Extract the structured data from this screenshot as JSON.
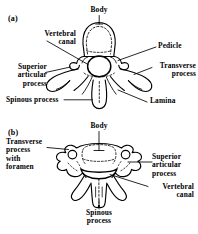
{
  "figure": {
    "background_color": "#ffffff",
    "ink_color": "#000000",
    "width": 198,
    "height": 234,
    "caption_style": "anatomical line drawing, superior view of vertebrae"
  },
  "panels": [
    {
      "tag": "(a)",
      "subject": "thoracic vertebra, superior view",
      "labels": [
        {
          "name": "body",
          "text": "Body",
          "lines": [
            "Body"
          ]
        },
        {
          "name": "vertebral-canal",
          "text": "Vertebral canal",
          "lines": [
            "Vertebral",
            "canal"
          ]
        },
        {
          "name": "superior-articular-process",
          "text": "Superior articular process",
          "lines": [
            "Superior",
            "articular",
            "process"
          ]
        },
        {
          "name": "spinous-process",
          "text": "Spinous process",
          "lines": [
            "Spinous process"
          ]
        },
        {
          "name": "pedicle",
          "text": "Pedicle",
          "lines": [
            "Pedicle"
          ]
        },
        {
          "name": "transverse-process",
          "text": "Transverse process",
          "lines": [
            "Transverse",
            "process"
          ]
        },
        {
          "name": "lamina",
          "text": "Lamina",
          "lines": [
            "Lamina"
          ]
        }
      ]
    },
    {
      "tag": "(b)",
      "subject": "cervical vertebra, superior view",
      "labels": [
        {
          "name": "body",
          "text": "Body",
          "lines": [
            "Body"
          ]
        },
        {
          "name": "transverse-process-with-foramen",
          "text": "Transverse process with foramen",
          "lines": [
            "Transverse",
            "process",
            "with",
            "foramen"
          ]
        },
        {
          "name": "superior-articular-process",
          "text": "Superior articular process",
          "lines": [
            "Superior",
            "articular",
            "process"
          ]
        },
        {
          "name": "vertebral-canal",
          "text": "Vertebral canal",
          "lines": [
            "Vertebral",
            "canal"
          ]
        },
        {
          "name": "spinous-process",
          "text": "Spinous process",
          "lines": [
            "Spinous",
            "process"
          ]
        }
      ]
    }
  ],
  "text": {
    "a": {
      "tag": "(a)",
      "body": "Body",
      "vertebral_canal_l1": "Vertebral",
      "vertebral_canal_l2": "canal",
      "superior_l1": "Superior",
      "superior_l2": "articular",
      "superior_l3": "process",
      "spinous": "Spinous process",
      "pedicle": "Pedicle",
      "transverse_l1": "Transverse",
      "transverse_l2": "process",
      "lamina": "Lamina"
    },
    "b": {
      "tag": "(b)",
      "body": "Body",
      "transverse_l1": "Transverse",
      "transverse_l2": "process",
      "transverse_l3": "with",
      "transverse_l4": "foramen",
      "superior_l1": "Superior",
      "superior_l2": "articular",
      "superior_l3": "process",
      "vertebral_canal_l1": "Vertebral",
      "vertebral_canal_l2": "canal",
      "spinous_l1": "Spinous",
      "spinous_l2": "process"
    }
  }
}
